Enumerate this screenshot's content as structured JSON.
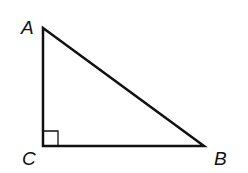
{
  "diagram": {
    "type": "right-triangle",
    "vertices": {
      "A": {
        "label": "A",
        "x": 43,
        "y": 28
      },
      "B": {
        "label": "B",
        "x": 204,
        "y": 146
      },
      "C": {
        "label": "C",
        "x": 43,
        "y": 146
      }
    },
    "right_angle_at": "C",
    "right_angle_marker_size": 15,
    "stroke_color": "#111111"
  }
}
